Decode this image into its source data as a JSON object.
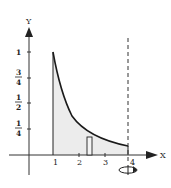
{
  "diagram": {
    "type": "region-revolution-shell",
    "curve": "y = 1/x^2",
    "domain": [
      1,
      4
    ],
    "axis_of_revolution": "x = 4",
    "axes": {
      "x_label": "X",
      "y_label": "Y",
      "x_ticks": [
        "1",
        "2",
        "3",
        "4"
      ],
      "y_ticks": [
        {
          "num": "1",
          "den": ""
        },
        {
          "num": "3",
          "den": "4"
        },
        {
          "num": "1",
          "den": "2"
        },
        {
          "num": "1",
          "den": "4"
        }
      ]
    },
    "colors": {
      "curve": "#1a1a1a",
      "fill": "#ececec",
      "axis": "#333333"
    }
  }
}
